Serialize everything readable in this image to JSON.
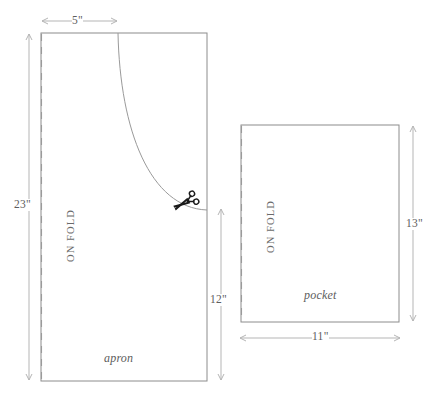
{
  "diagram": {
    "colors": {
      "outline": "#8c8c8c",
      "fold_line": "#9a9a9a",
      "dimension_line": "#b5b5b5",
      "curve": "#9a9a9a",
      "text": "#5d5d5d",
      "scissors": "#1a1a1a",
      "background": "#ffffff"
    },
    "pieces": [
      {
        "name": "apron",
        "label": "apron",
        "fold_label": "ON FOLD",
        "dimensions": [
          {
            "id": "width-5",
            "value": "5\"",
            "orientation": "horizontal",
            "position": "top"
          },
          {
            "id": "height-23",
            "value": "23\"",
            "orientation": "vertical",
            "position": "left"
          },
          {
            "id": "height-12",
            "value": "12\"",
            "orientation": "vertical",
            "position": "right"
          }
        ],
        "rect": {
          "x": 41,
          "y": 33,
          "width": 166,
          "height": 348
        },
        "fold_line_x": 41,
        "cut_curve": {
          "start": {
            "x": 118,
            "y": 33
          },
          "end": {
            "x": 207,
            "y": 210
          },
          "control1": {
            "x": 120,
            "y": 130
          },
          "control2": {
            "x": 150,
            "y": 208
          }
        },
        "has_scissors": true
      },
      {
        "name": "pocket",
        "label": "pocket",
        "fold_label": "ON FOLD",
        "dimensions": [
          {
            "id": "height-13",
            "value": "13\"",
            "orientation": "vertical",
            "position": "right"
          },
          {
            "id": "width-11",
            "value": "11\"",
            "orientation": "horizontal",
            "position": "bottom"
          }
        ],
        "rect": {
          "x": 241,
          "y": 125,
          "width": 158,
          "height": 197
        },
        "fold_line_x": 241,
        "has_scissors": false
      }
    ],
    "icons": [
      {
        "name": "scissors-icon",
        "x": 186,
        "y": 202,
        "rotation": -28
      }
    ]
  }
}
